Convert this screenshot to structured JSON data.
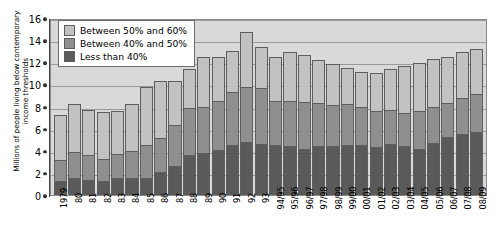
{
  "chart_data": {
    "type": "bar",
    "stacked": true,
    "title": "",
    "xlabel": "",
    "ylabel": "Millions of people living below contemporary\nincome thresholds",
    "ylim": [
      0,
      16
    ],
    "yticks": [
      0,
      2,
      4,
      6,
      8,
      10,
      12,
      14,
      16
    ],
    "grid": true,
    "legend_position": "top-left",
    "categories": [
      "1979",
      "80",
      "81",
      "82",
      "83",
      "84",
      "85",
      "86",
      "87",
      "88",
      "89",
      "90",
      "91",
      "92",
      "93",
      "94/95",
      "95/96",
      "96/97",
      "97/98",
      "98/99",
      "99/00",
      "00/01",
      "01/02",
      "02/03",
      "03/04",
      "04/05",
      "05/06",
      "06/07",
      "07/08",
      "08/09"
    ],
    "series": [
      {
        "name": "Less than 40%",
        "color": "#5a5a5a",
        "values": [
          1.3,
          1.5,
          1.4,
          1.3,
          1.5,
          1.5,
          1.5,
          2.1,
          2.6,
          3.6,
          3.8,
          4.1,
          4.5,
          4.8,
          4.6,
          4.5,
          4.4,
          4.2,
          4.4,
          4.4,
          4.5,
          4.5,
          4.3,
          4.6,
          4.4,
          4.2,
          4.7,
          5.2,
          5.5,
          5.7
        ]
      },
      {
        "name": "Between 40% and 50%",
        "color": "#8f8f8f",
        "values": [
          1.9,
          2.4,
          2.2,
          2.0,
          2.2,
          2.5,
          3.0,
          3.1,
          3.7,
          4.3,
          4.2,
          4.4,
          4.8,
          5.0,
          5.1,
          4.0,
          4.1,
          4.2,
          3.9,
          3.7,
          3.7,
          3.5,
          3.3,
          3.1,
          3.0,
          3.4,
          3.3,
          3.1,
          3.3,
          3.4
        ]
      },
      {
        "name": "Between 50% and 60%",
        "color": "#c2c2c2",
        "values": [
          4.0,
          4.3,
          4.1,
          4.2,
          3.9,
          4.2,
          5.3,
          5.1,
          4.0,
          3.5,
          4.5,
          4.0,
          3.7,
          4.9,
          3.7,
          4.0,
          4.4,
          4.3,
          3.9,
          3.7,
          3.3,
          3.1,
          3.4,
          3.7,
          4.3,
          4.3,
          4.3,
          4.2,
          4.1,
          4.1
        ]
      }
    ],
    "totals": [
      7.2,
      8.2,
      7.7,
      7.5,
      7.6,
      8.2,
      9.8,
      10.3,
      10.3,
      11.4,
      12.5,
      12.5,
      13.0,
      14.7,
      13.4,
      12.5,
      12.9,
      12.7,
      12.2,
      11.8,
      11.5,
      11.1,
      11.0,
      11.4,
      11.7,
      11.9,
      12.3,
      12.5,
      12.9,
      13.2
    ]
  },
  "legend": {
    "items": [
      {
        "label": "Between 50% and 60%",
        "color": "#c2c2c2"
      },
      {
        "label": "Between 40% and 50%",
        "color": "#8f8f8f"
      },
      {
        "label": "Less than 40%",
        "color": "#5a5a5a"
      }
    ]
  }
}
